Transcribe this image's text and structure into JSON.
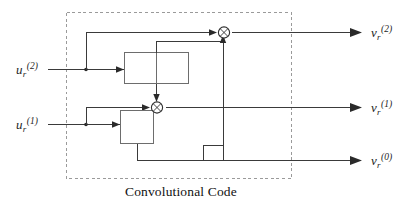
{
  "figure": {
    "kind": "block-diagram",
    "caption": "Convolutional Code",
    "boundary": {
      "style": "dashed",
      "label": "Convolutional Code"
    }
  },
  "inputs": [
    {
      "id": "u2",
      "base": "u",
      "sub": "r",
      "sup": "(2)",
      "text": "u_r^(2)"
    },
    {
      "id": "u1",
      "base": "u",
      "sub": "r",
      "sup": "(1)",
      "text": "u_r^(1)"
    }
  ],
  "outputs": [
    {
      "id": "v2",
      "base": "v",
      "sub": "r",
      "sup": "(2)",
      "text": "v_r^(2)"
    },
    {
      "id": "v1",
      "base": "v",
      "sub": "r",
      "sup": "(1)",
      "text": "v_r^(1)"
    },
    {
      "id": "v0",
      "base": "v",
      "sub": "r",
      "sup": "(0)",
      "text": "v_r^(0)"
    }
  ],
  "blocks": [
    {
      "id": "shift-register-upper",
      "cells": 2,
      "name": "delay-register-upper"
    },
    {
      "id": "shift-register-lower",
      "cells": 1,
      "name": "delay-register-lower"
    }
  ],
  "adders": [
    {
      "id": "adder-top",
      "symbol": "modulo-2-sum"
    },
    {
      "id": "adder-middle",
      "symbol": "modulo-2-sum"
    }
  ],
  "colors": {
    "wire": "#3a3a3a",
    "box_stroke": "#6d6d6d",
    "boundary": "#9a9a9a",
    "text": "#1d1d1d",
    "background": "#ffffff"
  }
}
